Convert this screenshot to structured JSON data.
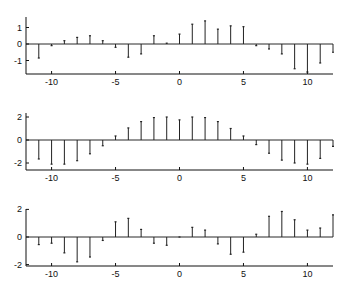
{
  "chart_data": [
    {
      "type": "stem",
      "title": "",
      "xlabel": "",
      "ylabel": "",
      "xlim": [
        -12,
        12
      ],
      "ylim": [
        -1.8,
        1.65
      ],
      "xticks": [
        -10,
        -5,
        0,
        5,
        10
      ],
      "yticks": [
        -1,
        0,
        1
      ],
      "grid": false,
      "x": [
        -11,
        -10,
        -9,
        -8,
        -7,
        -6,
        -5,
        -4,
        -3,
        -2,
        -1,
        0,
        1,
        2,
        3,
        4,
        5,
        6,
        7,
        8,
        9,
        10,
        11,
        12
      ],
      "values": [
        -0.85,
        -0.1,
        0.2,
        0.4,
        0.5,
        0.2,
        -0.2,
        -0.8,
        -0.6,
        0.5,
        0.05,
        0.6,
        1.2,
        1.4,
        0.9,
        1.1,
        1.05,
        -0.1,
        -0.3,
        -0.6,
        -1.5,
        -1.7,
        -1.15,
        -0.5
      ]
    },
    {
      "type": "stem",
      "title": "",
      "xlabel": "",
      "ylabel": "",
      "xlim": [
        -12,
        12
      ],
      "ylim": [
        -2.6,
        2.35
      ],
      "xticks": [
        -10,
        -5,
        0,
        5,
        10
      ],
      "yticks": [
        -2,
        0,
        2
      ],
      "grid": false,
      "x": [
        -11,
        -10,
        -9,
        -8,
        -7,
        -6,
        -5,
        -4,
        -3,
        -2,
        -1,
        0,
        1,
        2,
        3,
        4,
        5,
        6,
        7,
        8,
        9,
        10,
        11,
        12
      ],
      "values": [
        -1.65,
        -2.1,
        -2.1,
        -1.8,
        -1.2,
        -0.5,
        0.35,
        1.05,
        1.6,
        1.95,
        2.0,
        1.75,
        2.0,
        1.95,
        1.6,
        1.0,
        0.35,
        -0.4,
        -1.15,
        -1.75,
        -2.0,
        -2.1,
        -1.6,
        -0.55
      ]
    },
    {
      "type": "stem",
      "title": "",
      "xlabel": "",
      "ylabel": "",
      "xlim": [
        -12,
        12
      ],
      "ylim": [
        -2.1,
        2.1
      ],
      "xticks": [
        -10,
        -5,
        0,
        5,
        10
      ],
      "yticks": [
        -2,
        0,
        2
      ],
      "grid": false,
      "x": [
        -11,
        -10,
        -9,
        -8,
        -7,
        -6,
        -5,
        -4,
        -3,
        -2,
        -1,
        0,
        1,
        2,
        3,
        4,
        5,
        6,
        7,
        8,
        9,
        10,
        11,
        12
      ],
      "values": [
        -0.55,
        -0.45,
        -1.15,
        -1.8,
        -1.45,
        -0.25,
        1.1,
        1.35,
        0.55,
        -0.45,
        -0.6,
        0.0,
        0.7,
        0.5,
        -0.5,
        -1.25,
        -1.1,
        0.2,
        1.5,
        1.85,
        1.25,
        0.5,
        0.65,
        1.6
      ]
    }
  ],
  "layout": {
    "panels": [
      {
        "top": 17,
        "bottom": 74,
        "zero": 44,
        "ppu": 16.5
      },
      {
        "top": 113,
        "bottom": 170,
        "zero": 140,
        "ppu": 11.5
      },
      {
        "top": 209,
        "bottom": 266,
        "zero": 237,
        "ppu": 13.8
      }
    ],
    "x_left": 26,
    "x_right": 333,
    "x_min": -12,
    "x_max": 12,
    "stem_color": "#222222",
    "axis_color": "#111111"
  }
}
